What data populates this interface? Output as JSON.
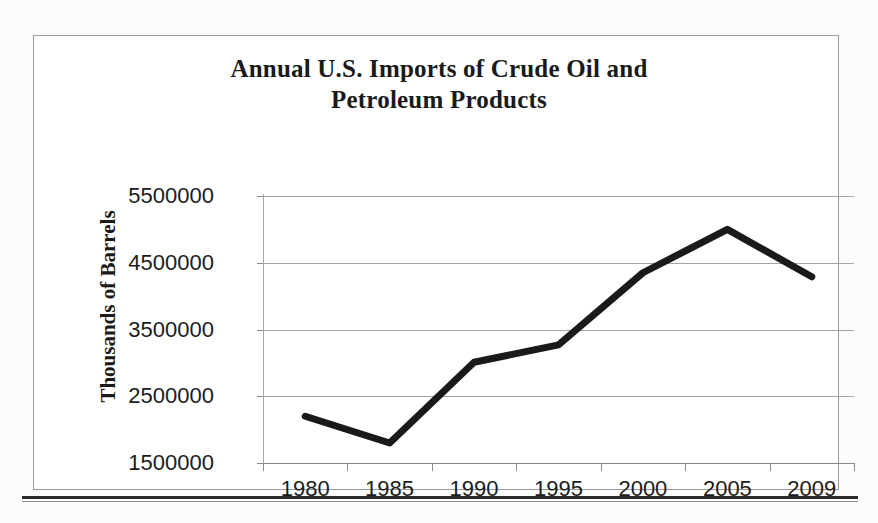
{
  "page": {
    "background_color": "#fcfcfb",
    "frame_color": "#9a9a9a",
    "rule_color": "#2b2b2b"
  },
  "chart_data": {
    "type": "line",
    "title": "Annual U.S. Imports of Crude Oil and Petroleum Products",
    "title_line_1": "Annual U.S. Imports of Crude Oil and",
    "title_line_2": "Petroleum Products",
    "subtitle": "",
    "xlabel": "",
    "ylabel": "Thousands  of Barrels",
    "categories": [
      "1980",
      "1985",
      "1990",
      "1995",
      "2000",
      "2005",
      "2009"
    ],
    "values": [
      2200000,
      1800000,
      3010000,
      3270000,
      4350000,
      5000000,
      4290000
    ],
    "series": [
      {
        "name": "Annual U.S. Imports of Crude Oil and Petroleum Products",
        "values": [
          2200000,
          1800000,
          3010000,
          3270000,
          4350000,
          5000000,
          4290000
        ],
        "color": "#1a1a1a",
        "line_width": 7
      }
    ],
    "ytick_labels": [
      "1500000",
      "2500000",
      "3500000",
      "4500000",
      "5500000"
    ],
    "ytick_values": [
      1500000,
      2500000,
      3500000,
      4500000,
      5500000
    ],
    "ylim": [
      1500000,
      5500000
    ],
    "grid": true,
    "grid_color": "#a5a5a5",
    "legend": false,
    "legend_position": "none",
    "axis_color": "#8a8a8a",
    "annotations": []
  }
}
